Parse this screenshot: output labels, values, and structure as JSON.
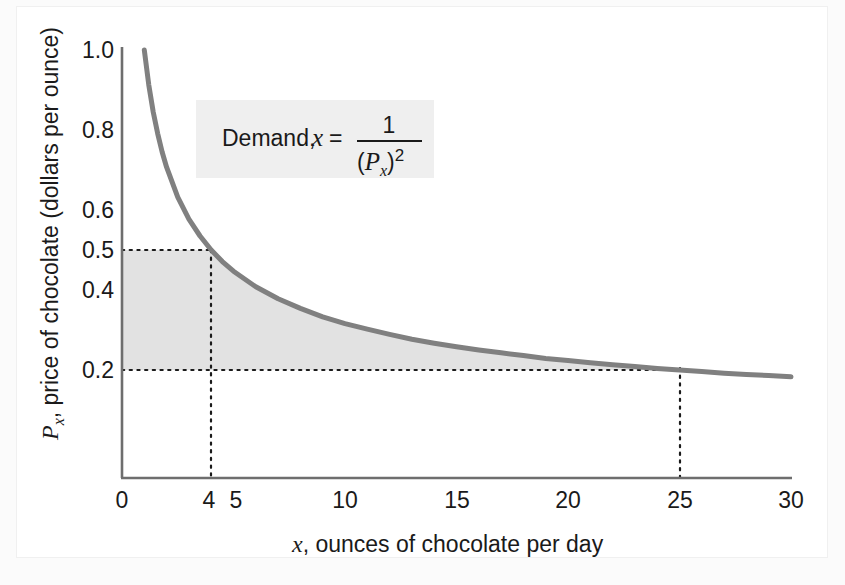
{
  "figure": {
    "background": "#fbfbfb",
    "plate_background": "#ffffff"
  },
  "chart_data": {
    "type": "line",
    "title": "",
    "subtitle": "",
    "xlabel": "x, ounces of chocolate per day",
    "xlabel_symbol": "x",
    "xlabel_rest": ", ounces of chocolate per day",
    "ylabel": "Px, price of chocolate (dollars per ounce)",
    "ylabel_symbol": "P",
    "ylabel_subscript": "x",
    "ylabel_rest": ", price of chocolate (dollars per ounce)",
    "xlim": [
      0,
      30
    ],
    "ylim": [
      0,
      1.0
    ],
    "grid": false,
    "legend_position": "none",
    "xticks": [
      0,
      4,
      5,
      10,
      15,
      20,
      25,
      30
    ],
    "xtick_labels": [
      "0",
      "4",
      "5",
      "10",
      "15",
      "20",
      "25",
      "30"
    ],
    "yticks": [
      0.2,
      0.4,
      0.5,
      0.6,
      0.8,
      1.0
    ],
    "ytick_labels": [
      "0.2",
      "0.4",
      "0.5",
      "0.6",
      "0.8",
      "1.0"
    ],
    "series": [
      {
        "name": "Demand",
        "equation_label": "Demand, x = 1/(Px)^2",
        "color": "#808080",
        "linewidth": 5,
        "x": [
          1.0,
          1.2,
          1.4,
          1.6,
          1.8,
          2.0,
          2.5,
          3.0,
          3.5,
          4.0,
          4.5,
          5.0,
          6.0,
          7.0,
          8.0,
          9.0,
          10.0,
          11.0,
          12.0,
          13.0,
          14.0,
          15.0,
          16.0,
          17.0,
          18.0,
          19.0,
          20.0,
          21.0,
          22.0,
          23.0,
          24.0,
          25.0,
          26.0,
          27.0,
          28.0,
          29.0,
          30.0
        ],
        "y": [
          1.0,
          0.913,
          0.845,
          0.791,
          0.745,
          0.707,
          0.632,
          0.577,
          0.535,
          0.5,
          0.471,
          0.447,
          0.408,
          0.378,
          0.354,
          0.333,
          0.316,
          0.302,
          0.289,
          0.277,
          0.267,
          0.258,
          0.25,
          0.243,
          0.236,
          0.229,
          0.224,
          0.218,
          0.213,
          0.209,
          0.204,
          0.2,
          0.196,
          0.192,
          0.189,
          0.186,
          0.183
        ]
      }
    ],
    "annotations": [
      {
        "name": "formula-box",
        "text_prefix": "Demand,",
        "variable": "x",
        "equals": "=",
        "numerator": "1",
        "denominator_open": "(",
        "denominator_symbol": "P",
        "denominator_subscript": "x",
        "denominator_close": ")",
        "exponent": "2",
        "background": "#efefef"
      }
    ],
    "reference_lines": [
      {
        "name": "price-0.5-dotted",
        "type": "horizontal",
        "value": 0.5,
        "from_x": 0,
        "to_x": 4,
        "style": "dotted"
      },
      {
        "name": "price-0.2-dotted",
        "type": "horizontal",
        "value": 0.2,
        "from_x": 0,
        "to_x": 25,
        "style": "dotted"
      },
      {
        "name": "quantity-4-dotted",
        "type": "vertical",
        "value": 4,
        "from_y": 0,
        "to_y": 0.5,
        "style": "dotted"
      },
      {
        "name": "quantity-25-dotted",
        "type": "vertical",
        "value": 25,
        "from_y": 0,
        "to_y": 0.2,
        "style": "dotted"
      }
    ],
    "shaded_region": {
      "name": "consumer-expenditure-area",
      "description": "Area under demand curve from x=0 to x=25 above price 0.2",
      "color": "#e2e2e2",
      "x_range": [
        0,
        25
      ],
      "y_floor": 0.2
    },
    "key_points": [
      {
        "x": 4,
        "y": 0.5
      },
      {
        "x": 25,
        "y": 0.2
      }
    ]
  }
}
